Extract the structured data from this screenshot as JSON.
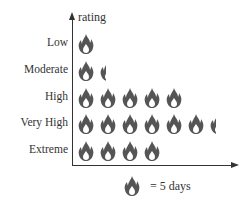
{
  "chart_data": {
    "type": "pictograph",
    "title": "",
    "ylabel": "rating",
    "xlabel": "",
    "unit_label": "= 5 days",
    "unit_value": 5,
    "icon": "flame-icon",
    "categories": [
      "Low",
      "Moderate",
      "High",
      "Very High",
      "Extreme"
    ],
    "icon_counts": [
      1,
      1.4,
      5,
      6.4,
      4
    ],
    "values": [
      5,
      7,
      25,
      32,
      20
    ],
    "grid": false,
    "legend_position": "bottom"
  },
  "colors": {
    "icon": "#555555",
    "axis": "#333333",
    "text": "#333333"
  }
}
